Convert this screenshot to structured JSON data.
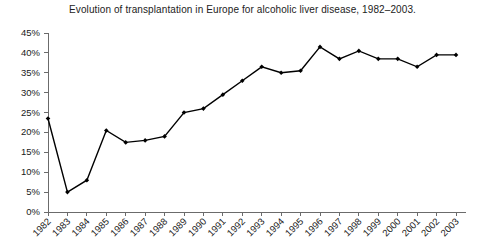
{
  "chart_data": {
    "type": "line",
    "title": "Evolution of transplantation in Europe for alcoholic liver disease, 1982–2003.",
    "xlabel": "",
    "ylabel": "",
    "categories": [
      "1982",
      "1983",
      "1984",
      "1985",
      "1986",
      "1987",
      "1988",
      "1989",
      "1990",
      "1991",
      "1992",
      "1993",
      "1994",
      "1995",
      "1996",
      "1997",
      "1998",
      "1999",
      "2000",
      "2001",
      "2002",
      "2003"
    ],
    "values": [
      23.5,
      5.0,
      8.0,
      20.5,
      17.5,
      18.0,
      19.0,
      25.0,
      26.0,
      29.5,
      33.0,
      36.5,
      35.0,
      35.5,
      41.5,
      38.5,
      40.5,
      38.5,
      38.5,
      36.5,
      39.5,
      39.5
    ],
    "series": [
      {
        "name": "Alcoholic liver disease share",
        "values": [
          23.5,
          5.0,
          8.0,
          20.5,
          17.5,
          18.0,
          19.0,
          25.0,
          26.0,
          29.5,
          33.0,
          36.5,
          35.0,
          35.5,
          41.5,
          38.5,
          40.5,
          38.5,
          38.5,
          36.5,
          39.5,
          39.5
        ]
      }
    ],
    "ytick_labels": [
      "0%",
      "5%",
      "10%",
      "15%",
      "20%",
      "25%",
      "30%",
      "35%",
      "40%",
      "45%"
    ],
    "ytick_values": [
      0,
      5,
      10,
      15,
      20,
      25,
      30,
      35,
      40,
      45
    ],
    "ylim": [
      0,
      45
    ],
    "grid": false,
    "legend": false,
    "marker": "filled-diamond",
    "line_color": "#000000",
    "axis_color": "#6b6b6b",
    "xtick_label_rotation": -45
  }
}
